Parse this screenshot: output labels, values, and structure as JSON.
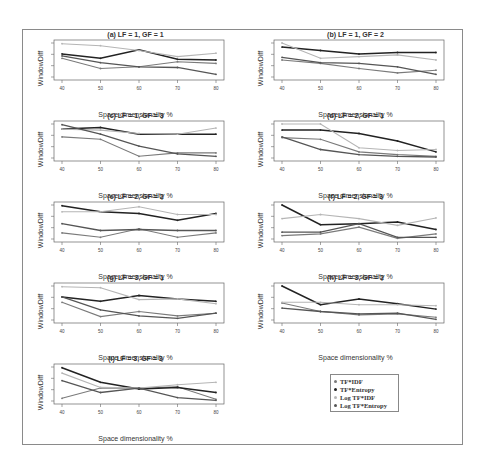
{
  "chart_data": [
    {
      "type": "line",
      "title": "(a) LF = 1, GF = 1",
      "xlabel": "Space dimensionality %",
      "ylabel": "WindowDiff",
      "categories": [
        "40",
        "50",
        "60",
        "70",
        "80"
      ],
      "series": [
        {
          "name": "TF*IDF",
          "values": [
            0.55,
            0.25,
            0.3,
            0.45,
            0.4
          ]
        },
        {
          "name": "TF*Entropy",
          "values": [
            0.68,
            0.55,
            0.8,
            0.52,
            0.5
          ]
        },
        {
          "name": "Log TF*IDF",
          "values": [
            0.98,
            0.92,
            0.78,
            0.6,
            0.7
          ]
        },
        {
          "name": "Log TF*Entropy",
          "values": [
            0.62,
            0.42,
            0.3,
            0.28,
            0.08
          ]
        }
      ]
    },
    {
      "type": "line",
      "title": "(b) LF = 1, GF = 2",
      "xlabel": "Space dimensionality %",
      "ylabel": "WindowDiff",
      "categories": [
        "40",
        "50",
        "60",
        "70",
        "80"
      ],
      "series": [
        {
          "name": "TF*IDF",
          "values": [
            0.5,
            0.4,
            0.25,
            0.12,
            0.2
          ]
        },
        {
          "name": "TF*Entropy",
          "values": [
            0.88,
            0.78,
            0.68,
            0.72,
            0.72
          ]
        },
        {
          "name": "Log TF*IDF",
          "values": [
            1.0,
            0.55,
            0.6,
            0.65,
            0.5
          ]
        },
        {
          "name": "Log TF*Entropy",
          "values": [
            0.58,
            0.42,
            0.4,
            0.3,
            0.08
          ]
        }
      ]
    },
    {
      "type": "line",
      "title": "(c) LF = 1, GF = 3",
      "xlabel": "Space dimensionality %",
      "ylabel": "WindowDiff",
      "categories": [
        "40",
        "50",
        "60",
        "70",
        "80"
      ],
      "series": [
        {
          "name": "TF*IDF",
          "values": [
            0.62,
            0.55,
            0.05,
            0.15,
            0.15
          ]
        },
        {
          "name": "TF*Entropy",
          "values": [
            0.85,
            0.9,
            0.7,
            0.7,
            0.7
          ]
        },
        {
          "name": "Log TF*IDF",
          "values": [
            0.85,
            0.82,
            0.72,
            0.7,
            0.88
          ]
        },
        {
          "name": "Log TF*Entropy",
          "values": [
            0.98,
            0.7,
            0.35,
            0.12,
            0.05
          ]
        }
      ]
    },
    {
      "type": "line",
      "title": "(d) LF = 2, GF = 1",
      "xlabel": "Space dimensionality %",
      "ylabel": "WindowDiff",
      "categories": [
        "40",
        "50",
        "60",
        "70",
        "80"
      ],
      "series": [
        {
          "name": "TF*IDF",
          "values": [
            0.6,
            0.55,
            0.18,
            0.1,
            0.05
          ]
        },
        {
          "name": "TF*Entropy",
          "values": [
            0.82,
            0.82,
            0.72,
            0.5,
            0.18
          ]
        },
        {
          "name": "Log TF*IDF",
          "values": [
            1.0,
            1.0,
            0.3,
            0.22,
            0.25
          ]
        },
        {
          "name": "Log TF*Entropy",
          "values": [
            0.62,
            0.25,
            0.1,
            0.05,
            0.03
          ]
        }
      ]
    },
    {
      "type": "line",
      "title": "(e) LF = 2, GF = 2",
      "xlabel": "Space dimensionality %",
      "ylabel": "WindowDiff",
      "categories": [
        "40",
        "50",
        "60",
        "70",
        "80"
      ],
      "series": [
        {
          "name": "TF*IDF",
          "values": [
            0.18,
            0.05,
            0.3,
            0.05,
            0.18
          ]
        },
        {
          "name": "TF*Entropy",
          "values": [
            0.98,
            0.8,
            0.75,
            0.55,
            0.75
          ]
        },
        {
          "name": "Log TF*IDF",
          "values": [
            0.8,
            0.8,
            0.95,
            0.72,
            0.72
          ]
        },
        {
          "name": "Log TF*Entropy",
          "values": [
            0.45,
            0.25,
            0.28,
            0.25,
            0.25
          ]
        }
      ]
    },
    {
      "type": "line",
      "title": "(f) LF = 2, GF = 3",
      "xlabel": "Space dimensionality %",
      "ylabel": "WindowDiff",
      "categories": [
        "40",
        "50",
        "60",
        "70",
        "80"
      ],
      "series": [
        {
          "name": "TF*IDF",
          "values": [
            0.1,
            0.15,
            0.35,
            0.02,
            0.15
          ]
        },
        {
          "name": "TF*Entropy",
          "values": [
            1.0,
            0.42,
            0.45,
            0.5,
            0.28
          ]
        },
        {
          "name": "Log TF*IDF",
          "values": [
            0.6,
            0.72,
            0.6,
            0.4,
            0.62
          ]
        },
        {
          "name": "Log TF*Entropy",
          "values": [
            0.2,
            0.2,
            0.45,
            0.05,
            0.05
          ]
        }
      ]
    },
    {
      "type": "line",
      "title": "(g) LF = 3, GF = 1",
      "xlabel": "Space dimensionality %",
      "ylabel": "WindowDiff",
      "categories": [
        "40",
        "50",
        "60",
        "70",
        "80"
      ],
      "series": [
        {
          "name": "TF*IDF",
          "values": [
            0.52,
            0.1,
            0.25,
            0.12,
            0.2
          ]
        },
        {
          "name": "TF*Entropy",
          "values": [
            0.68,
            0.55,
            0.72,
            0.62,
            0.55
          ]
        },
        {
          "name": "Log TF*IDF",
          "values": [
            0.98,
            0.95,
            0.6,
            0.62,
            0.48
          ]
        },
        {
          "name": "Log TF*Entropy",
          "values": [
            0.68,
            0.3,
            0.12,
            0.05,
            0.2
          ]
        }
      ]
    },
    {
      "type": "line",
      "title": "(h) LF = 3, GF = 2",
      "xlabel": "Space dimensionality %",
      "ylabel": "WindowDiff",
      "categories": [
        "40",
        "50",
        "60",
        "70",
        "80"
      ],
      "series": [
        {
          "name": "TF*IDF",
          "values": [
            0.5,
            0.25,
            0.15,
            0.18,
            0.08
          ]
        },
        {
          "name": "TF*Entropy",
          "values": [
            1.0,
            0.45,
            0.62,
            0.48,
            0.32
          ]
        },
        {
          "name": "Log TF*IDF",
          "values": [
            0.52,
            0.52,
            0.45,
            0.45,
            0.42
          ]
        },
        {
          "name": "Log TF*Entropy",
          "values": [
            0.35,
            0.25,
            0.18,
            0.2,
            0.02
          ]
        }
      ]
    },
    {
      "type": "line",
      "title": "(i) LF = 3, GF = 3",
      "xlabel": "Space dimensionality %",
      "ylabel": "WindowDiff",
      "categories": [
        "40",
        "50",
        "60",
        "70",
        "80"
      ],
      "series": [
        {
          "name": "TF*IDF",
          "values": [
            0.08,
            0.38,
            0.38,
            0.42,
            0.05
          ]
        },
        {
          "name": "TF*Entropy",
          "values": [
            0.98,
            0.55,
            0.35,
            0.4,
            0.25
          ]
        },
        {
          "name": "Log TF*IDF",
          "values": [
            0.82,
            0.4,
            0.38,
            0.48,
            0.55
          ]
        },
        {
          "name": "Log TF*Entropy",
          "values": [
            0.6,
            0.25,
            0.38,
            0.1,
            0.02
          ]
        }
      ]
    }
  ],
  "legend": {
    "items": [
      {
        "label": "TF*IDF",
        "color": "#7a7a7a"
      },
      {
        "label": "TF*Entropy",
        "color": "#222222"
      },
      {
        "label": "Log TF*IDF",
        "color": "#b5b5b5"
      },
      {
        "label": "Log TF*Entropy",
        "color": "#555555"
      }
    ]
  }
}
